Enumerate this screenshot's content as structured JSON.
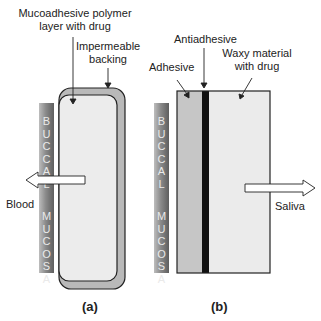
{
  "figure": {
    "panel_a": {
      "caption": "(a)",
      "labels": {
        "polymer_layer_line1": "Mucoadhesive polymer",
        "polymer_layer_line2": "layer with drug",
        "backing_line1": "Impermeable",
        "backing_line2": "backing",
        "flow": "Blood"
      },
      "mucosa_letters": [
        "B",
        "U",
        "C",
        "C",
        "A",
        "L",
        "",
        "M",
        "U",
        "C",
        "O",
        "S",
        "A"
      ]
    },
    "panel_b": {
      "caption": "(b)",
      "labels": {
        "antiadhesive": "Antiadhesive",
        "adhesive": "Adhesive",
        "waxy_line1": "Waxy material",
        "waxy_line2": "with drug",
        "flow": "Saliva"
      },
      "mucosa_letters": [
        "B",
        "U",
        "C",
        "C",
        "A",
        "L",
        "",
        "M",
        "U",
        "C",
        "O",
        "S",
        "A"
      ]
    },
    "colors": {
      "backing": "#b9b9b9",
      "polymer_layer": "#ececec",
      "adhesive": "#c6c6c6",
      "antiadhesive": "#111111",
      "waxy": "#ebebeb",
      "outline": "#222222"
    }
  }
}
